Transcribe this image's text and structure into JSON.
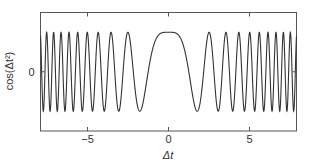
{
  "chart_data": {
    "type": "line",
    "title": "",
    "xlabel": "Δt",
    "ylabel": "cos(Δt²)",
    "function": "cos(x^2)",
    "xlim": [
      -7.9,
      7.9
    ],
    "ylim": [
      -1.5,
      1.5
    ],
    "xticks": [
      -5,
      0,
      5
    ],
    "xtick_labels": [
      "−5",
      "0",
      "5"
    ],
    "yticks": [
      0
    ],
    "ytick_labels": [
      "0"
    ],
    "grid": false,
    "legend": null,
    "series": [
      {
        "name": "cos(Δt²)",
        "x": [
          -7.9,
          -6,
          -5,
          -4,
          -3,
          -2,
          -1.5,
          -1,
          -0.5,
          0,
          0.5,
          1,
          1.5,
          2,
          3,
          4,
          5,
          6,
          7.9
        ],
        "y": [
          0.91,
          -0.99,
          0.99,
          -0.96,
          -0.91,
          -0.65,
          -0.63,
          0.54,
          0.97,
          1.0,
          0.97,
          0.54,
          -0.63,
          -0.65,
          -0.91,
          -0.96,
          0.99,
          -0.99,
          0.91
        ]
      }
    ],
    "line_color": "#333333"
  }
}
